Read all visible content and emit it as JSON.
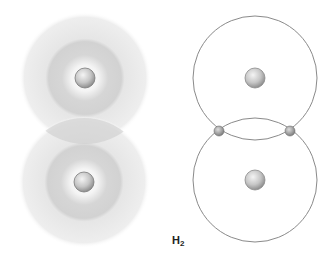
{
  "diagram": {
    "label": {
      "element": "H",
      "subscript": "2"
    },
    "colors": {
      "background": "#ffffff",
      "cloud_outer": "#ececec",
      "cloud_inner": "#d4d4d4",
      "overlap": "#c8c8c8",
      "orbit_line": "#8a8a8a",
      "nucleus": "#c4c4c4",
      "electron": "#a9a9a9",
      "label": "#222222"
    },
    "left_model": {
      "type": "electron-cloud",
      "atoms": [
        {
          "nucleus": {
            "cx": 85,
            "cy": 78,
            "r": 10
          },
          "cloud_outer_r": 66,
          "cloud_inner_r": 38
        },
        {
          "nucleus": {
            "cx": 84,
            "cy": 182,
            "r": 10
          },
          "cloud_outer_r": 66,
          "cloud_inner_r": 38
        }
      ]
    },
    "right_model": {
      "type": "orbit",
      "atoms": [
        {
          "nucleus": {
            "cx": 255,
            "cy": 78,
            "r": 10
          },
          "orbit_r": 62
        },
        {
          "nucleus": {
            "cx": 255,
            "cy": 180,
            "r": 10
          },
          "orbit_r": 62
        }
      ],
      "shared_electrons": [
        {
          "cx": 219,
          "cy": 131,
          "r": 5
        },
        {
          "cx": 290,
          "cy": 131,
          "r": 5
        }
      ]
    }
  }
}
